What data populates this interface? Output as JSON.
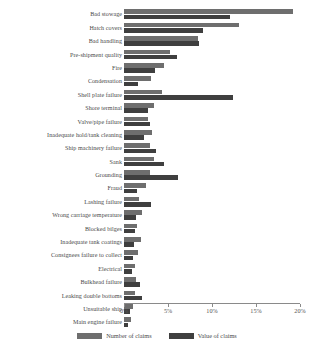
{
  "chart_data": {
    "type": "bar",
    "orientation": "horizontal",
    "title": "",
    "xlabel": "",
    "ylabel": "",
    "xlim": [
      0,
      20
    ],
    "xticks": [
      "0%",
      "5%",
      "10%",
      "15%",
      "20%"
    ],
    "xtick_values": [
      0,
      5,
      10,
      15,
      20
    ],
    "grid": false,
    "legend_position": "bottom-center",
    "categories": [
      "Bad stowage",
      "Hatch covers",
      "Bad handling",
      "Pre-shipment quality",
      "Fire",
      "Condensation",
      "Shell plate failure",
      "Shore terminal",
      "Valve/pipe failure",
      "Inadequate hold/tank cleaning",
      "Ship machinery failure",
      "Sank",
      "Grounding",
      "Fraud",
      "Lashing failure",
      "Wrong carriage temperature",
      "Blocked bilges",
      "Inadequate tank coatings",
      "Consignees failure to collect",
      "Electrical",
      "Bulkhead failure",
      "Leaking double bottoms",
      "Unsuitable ship",
      "Main engine failure"
    ],
    "series": [
      {
        "name": "Number of claims",
        "color": "#6e6e6e",
        "values": [
          19.2,
          13.1,
          8.4,
          5.2,
          4.6,
          3.1,
          4.3,
          3.4,
          2.7,
          3.2,
          2.9,
          3.4,
          2.9,
          2.5,
          1.7,
          2.1,
          1.5,
          1.9,
          1.6,
          1.3,
          1.4,
          1.2,
          1.0,
          0.8
        ]
      },
      {
        "name": "Value of claims",
        "color": "#3f3f3f",
        "values": [
          12.1,
          9.0,
          8.5,
          6.0,
          3.5,
          1.6,
          12.4,
          2.7,
          3.0,
          2.3,
          3.6,
          4.5,
          6.1,
          1.5,
          3.1,
          1.4,
          1.2,
          1.1,
          1.0,
          0.9,
          1.8,
          2.0,
          0.7,
          0.5
        ]
      }
    ]
  },
  "legend": {
    "items": [
      {
        "label": "Number of claims",
        "swatch_class": "num"
      },
      {
        "label": "Value of claims",
        "swatch_class": "val"
      }
    ]
  }
}
